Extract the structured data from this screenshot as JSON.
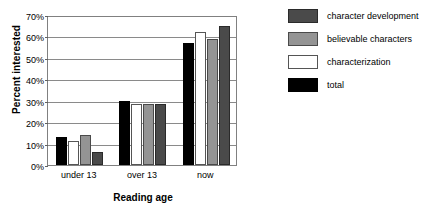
{
  "chart_data": {
    "type": "bar",
    "title": "",
    "xlabel": "Reading age",
    "ylabel": "Percent interested",
    "categories": [
      "under 13",
      "over 13",
      "now"
    ],
    "ylim": [
      0,
      70
    ],
    "yticks": [
      "0%",
      "10%",
      "20%",
      "30%",
      "40%",
      "50%",
      "60%",
      "70%"
    ],
    "ytick_values": [
      0,
      10,
      20,
      30,
      40,
      50,
      60,
      70
    ],
    "grid": true,
    "legend_position": "right",
    "series": [
      {
        "name": "character development",
        "color": "#4a4a4a",
        "values": [
          6,
          28.5,
          65
        ]
      },
      {
        "name": "believable characters",
        "color": "#949494",
        "values": [
          14,
          28.5,
          59
        ]
      },
      {
        "name": "characterization",
        "color": "#ffffff",
        "values": [
          11,
          28.5,
          62
        ]
      },
      {
        "name": "total",
        "color": "#000000",
        "values": [
          13,
          30,
          57
        ]
      }
    ],
    "draw_order": [
      "total",
      "characterization",
      "believable characters",
      "character development"
    ]
  },
  "legend": {
    "items": [
      {
        "label": "character development",
        "swatch": "#4a4a4a",
        "border": "#2a2a2a"
      },
      {
        "label": "believable characters",
        "swatch": "#949494",
        "border": "#4a4a4a"
      },
      {
        "label": "characterization",
        "swatch": "#ffffff",
        "border": "#555555"
      },
      {
        "label": "total",
        "swatch": "#000000",
        "border": "#000000"
      }
    ]
  }
}
